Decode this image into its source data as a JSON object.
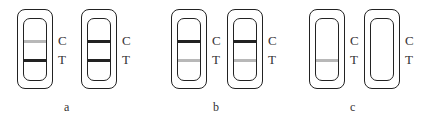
{
  "figure": {
    "colors": {
      "outline": "#222222",
      "band_strong": "#222222",
      "band_faint": "#b8b8b8"
    },
    "line_labels": {
      "control": "C",
      "test": "T"
    },
    "panels": [
      {
        "label": "a",
        "strips": [
          {
            "control_band": "faint",
            "test_band": "strong"
          },
          {
            "control_band": "strong",
            "test_band": "strong"
          }
        ]
      },
      {
        "label": "b",
        "strips": [
          {
            "control_band": "strong",
            "test_band": "faint"
          },
          {
            "control_band": "strong",
            "test_band": "faint"
          }
        ]
      },
      {
        "label": "c",
        "strips": [
          {
            "control_band": "none",
            "test_band": "faint"
          },
          {
            "control_band": "none",
            "test_band": "none"
          }
        ]
      }
    ]
  }
}
